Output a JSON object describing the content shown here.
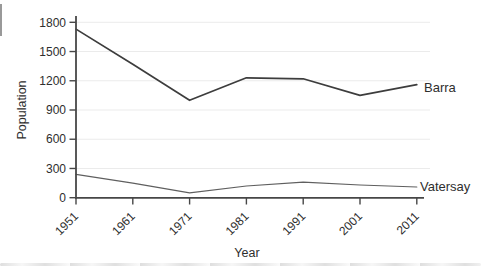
{
  "chart_data": {
    "type": "line",
    "x": [
      "1951",
      "1961",
      "1971",
      "1981",
      "1991",
      "2001",
      "2011"
    ],
    "series": [
      {
        "name": "Barra",
        "values": [
          1730,
          1370,
          1000,
          1230,
          1220,
          1050,
          1160
        ],
        "color": "#3d3d3d",
        "stroke_width": 1.7
      },
      {
        "name": "Vatersay",
        "values": [
          240,
          150,
          50,
          120,
          160,
          130,
          110
        ],
        "color": "#5f5f5f",
        "stroke_width": 1.2
      }
    ],
    "title": "",
    "xlabel": "Year",
    "ylabel": "Population",
    "ylim": [
      0,
      1800
    ],
    "yticks": [
      0,
      300,
      600,
      900,
      1200,
      1500,
      1800
    ],
    "grid": "horizontal",
    "gridline_color": "#ebebeb",
    "axis_color": "#474747",
    "legend_position": "end-of-line"
  }
}
